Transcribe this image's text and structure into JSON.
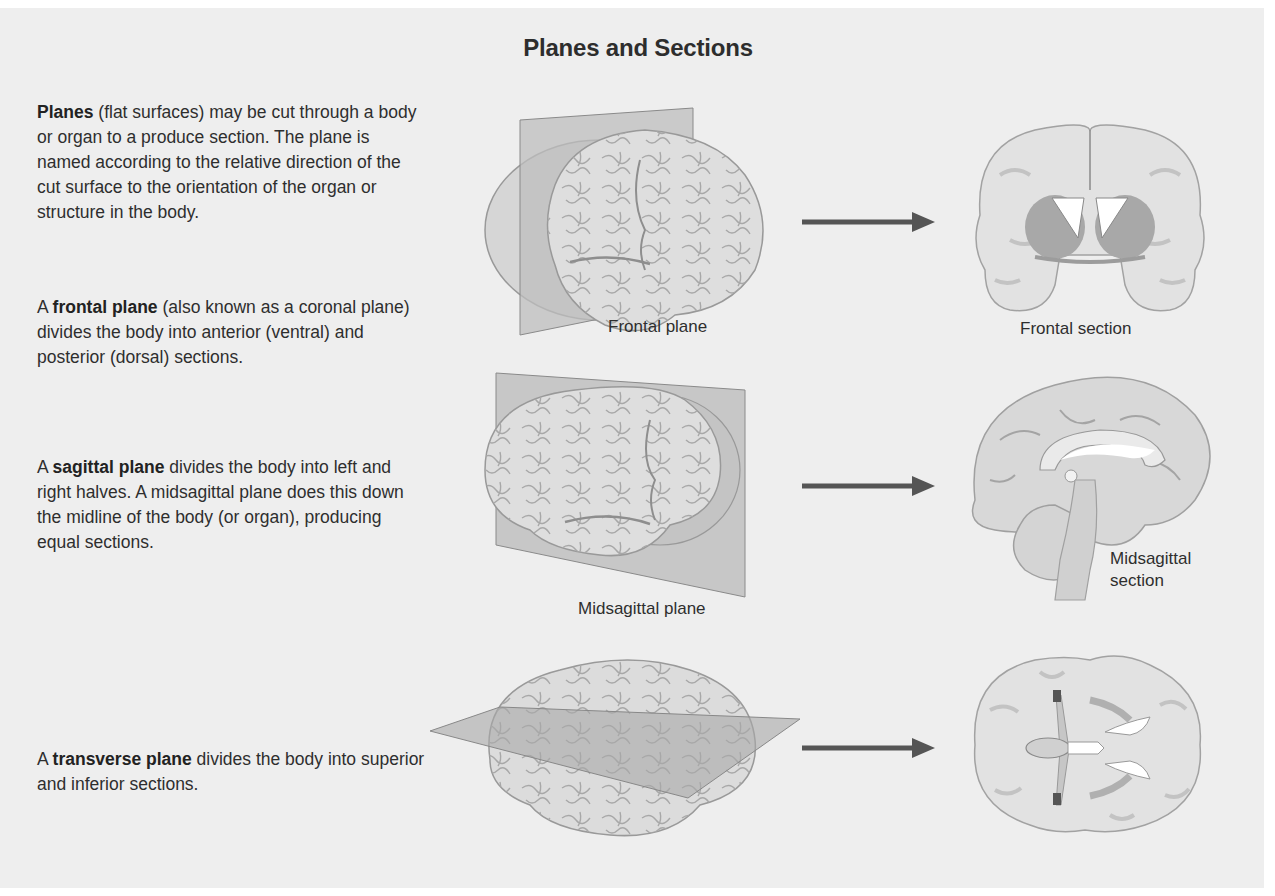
{
  "title": "Planes and Sections",
  "paragraphs": [
    {
      "bold": "Planes",
      "rest": " (flat surfaces) may be cut through a body or organ to a produce section. The plane is named according to the relative direction of the cut surface to the orientation of the organ or structure in the body."
    },
    {
      "prefix": "A ",
      "bold": "frontal plane",
      "rest": " (also known as a coronal plane) divides the body into anterior (ventral) and posterior (dorsal) sections."
    },
    {
      "prefix": "A ",
      "bold": "sagittal plane",
      "rest": " divides the body into left and right halves. A midsagittal plane does this down the midline of the body (or organ), producing equal sections."
    },
    {
      "prefix": "A ",
      "bold": "transverse plane",
      "rest": " divides the body into superior and inferior sections."
    }
  ],
  "labels": {
    "frontal_plane": "Frontal plane",
    "frontal_section": "Frontal section",
    "midsagittal_plane": "Midsagittal plane",
    "midsagittal_section_line1": "Midsagittal",
    "midsagittal_section_line2": "section"
  },
  "icons": {
    "arrow": "right-arrow-icon",
    "brain_lateral": "brain-lateral-illustration",
    "brain_coronal": "brain-coronal-section-illustration",
    "brain_sagittal": "brain-sagittal-section-illustration",
    "brain_axial": "brain-axial-section-illustration"
  },
  "colors": {
    "background": "#eeeeee",
    "brain_fill": "#dcdcdc",
    "brain_stroke": "#9a9a9a",
    "plane_fill": "#b8b8b8",
    "arrow": "#555555",
    "text": "#2e2e2e"
  }
}
